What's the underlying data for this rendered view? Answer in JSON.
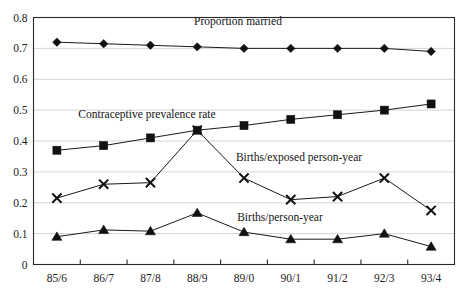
{
  "chart_data": {
    "type": "line",
    "title": "",
    "subtitle": "",
    "xlabel": "",
    "ylabel": "",
    "grid": true,
    "legend_position": "inline-annotations",
    "categories": [
      "85/6",
      "86/7",
      "87/8",
      "88/9",
      "89/0",
      "90/1",
      "91/2",
      "92/3",
      "93/4"
    ],
    "ylim": [
      0,
      0.8
    ],
    "yticks": [
      0,
      0.1,
      0.2,
      0.3,
      0.4,
      0.5,
      0.6,
      0.7,
      0.8
    ],
    "ytick_labels": [
      "0",
      "0.1",
      "0.2",
      "0.3",
      "0.4",
      "0.5",
      "0.6",
      "0.7",
      "0.8"
    ],
    "series": [
      {
        "name": "Proportion married",
        "marker": "diamond",
        "label_x_category_index": 4,
        "values": [
          0.72,
          0.715,
          0.71,
          0.705,
          0.7,
          0.7,
          0.7,
          0.7,
          0.69
        ]
      },
      {
        "name": "Contraceptive prevalence rate",
        "marker": "square",
        "label_x_category_index": 1,
        "values": [
          0.37,
          0.385,
          0.41,
          0.435,
          0.45,
          0.47,
          0.485,
          0.5,
          0.52
        ]
      },
      {
        "name": "Births/exposed person-year",
        "marker": "cross",
        "label_x_category_index": 5,
        "values": [
          0.215,
          0.26,
          0.265,
          0.435,
          0.28,
          0.21,
          0.22,
          0.28,
          0.175
        ]
      },
      {
        "name": "Births/person-year",
        "marker": "triangle",
        "label_x_category_index": 5,
        "values": [
          0.09,
          0.112,
          0.108,
          0.167,
          0.105,
          0.082,
          0.082,
          0.1,
          0.058
        ]
      }
    ],
    "annotations": [
      {
        "text": "Proportion married",
        "x": 238,
        "y": 25
      },
      {
        "text": "Contraceptive prevalence rate",
        "x": 147,
        "y": 118
      },
      {
        "text": "Births/exposed person-year",
        "x": 299,
        "y": 161
      },
      {
        "text": "Births/person-year",
        "x": 280,
        "y": 221
      }
    ]
  }
}
